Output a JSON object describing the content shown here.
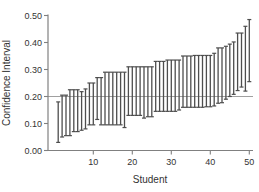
{
  "figure": {
    "background": "#ffffff",
    "axis_color": "#808080",
    "bar_color": "#4d4d4d",
    "reference_line_color": "#a0a0a0",
    "text_color": "#333333"
  },
  "chart_data": {
    "type": "bar",
    "subtype": "vertical-interval-errorbar",
    "title": "",
    "xlabel": "Student",
    "ylabel": "Confidence Interval",
    "xlim": [
      -1.6,
      51
    ],
    "ylim": [
      0.0,
      0.5
    ],
    "x_ticks": [
      10,
      20,
      30,
      40,
      50
    ],
    "y_ticks": [
      0.0,
      0.1,
      0.2,
      0.3,
      0.4,
      0.5
    ],
    "y_tick_labels": [
      "0.00",
      "0.10",
      "0.20",
      "0.30",
      "0.40",
      "0.50"
    ],
    "grid": false,
    "legend": "none",
    "reference_line_y": 0.2,
    "x": [
      1,
      2,
      3,
      4,
      5,
      6,
      7,
      8,
      9,
      10,
      11,
      12,
      13,
      14,
      15,
      16,
      17,
      18,
      19,
      20,
      21,
      22,
      23,
      24,
      25,
      26,
      27,
      28,
      29,
      30,
      31,
      32,
      33,
      34,
      35,
      36,
      37,
      38,
      39,
      40,
      41,
      42,
      43,
      44,
      45,
      46,
      47,
      48,
      49,
      50
    ],
    "intervals": [
      [
        0.03,
        0.18
      ],
      [
        0.05,
        0.205
      ],
      [
        0.055,
        0.205
      ],
      [
        0.055,
        0.225
      ],
      [
        0.07,
        0.225
      ],
      [
        0.07,
        0.225
      ],
      [
        0.075,
        0.218
      ],
      [
        0.08,
        0.228
      ],
      [
        0.095,
        0.25
      ],
      [
        0.095,
        0.25
      ],
      [
        0.115,
        0.27
      ],
      [
        0.095,
        0.27
      ],
      [
        0.095,
        0.29
      ],
      [
        0.095,
        0.29
      ],
      [
        0.095,
        0.29
      ],
      [
        0.095,
        0.29
      ],
      [
        0.095,
        0.29
      ],
      [
        0.085,
        0.29
      ],
      [
        0.13,
        0.31
      ],
      [
        0.13,
        0.31
      ],
      [
        0.13,
        0.31
      ],
      [
        0.13,
        0.31
      ],
      [
        0.12,
        0.31
      ],
      [
        0.125,
        0.31
      ],
      [
        0.125,
        0.31
      ],
      [
        0.145,
        0.33
      ],
      [
        0.145,
        0.33
      ],
      [
        0.145,
        0.33
      ],
      [
        0.145,
        0.335
      ],
      [
        0.145,
        0.335
      ],
      [
        0.145,
        0.335
      ],
      [
        0.15,
        0.335
      ],
      [
        0.16,
        0.35
      ],
      [
        0.16,
        0.35
      ],
      [
        0.16,
        0.35
      ],
      [
        0.16,
        0.352
      ],
      [
        0.16,
        0.352
      ],
      [
        0.16,
        0.352
      ],
      [
        0.162,
        0.352
      ],
      [
        0.162,
        0.352
      ],
      [
        0.165,
        0.36
      ],
      [
        0.175,
        0.38
      ],
      [
        0.177,
        0.38
      ],
      [
        0.19,
        0.386
      ],
      [
        0.2,
        0.394
      ],
      [
        0.208,
        0.402
      ],
      [
        0.222,
        0.435
      ],
      [
        0.235,
        0.435
      ],
      [
        0.22,
        0.46
      ],
      [
        0.255,
        0.485
      ]
    ]
  }
}
